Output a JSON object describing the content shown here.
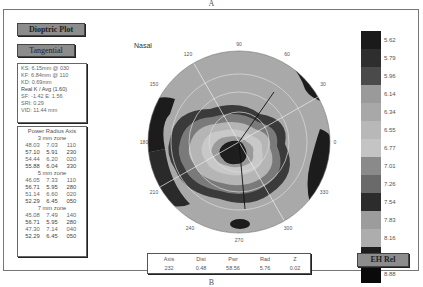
{
  "panel_labels": {
    "top": "A",
    "bottom": "B"
  },
  "header": {
    "plot_type_button": "Dioptric Plot",
    "map_type_button": "Tangential",
    "orientation_label": "Nasal"
  },
  "keratometry": {
    "ks": "KS:  6.15mm @ 030",
    "kf": "KF:  6.84mm @ 110",
    "kd": "KD:  0.69mm",
    "real_k": "Real K / Avg (1.60)",
    "sf_e": "SF:  -1.42   E:  1.56",
    "sri": "SRI:  0.29",
    "vid": "VID: 11.44 mm"
  },
  "power_radius_axis": {
    "title": "Power Radius Axis",
    "zones": [
      {
        "label": "3 mm zone",
        "rows": [
          [
            "48.03",
            "7.03",
            "110"
          ],
          [
            "57.10",
            "5.91",
            "230"
          ],
          [
            "54.44",
            "6.20",
            "020"
          ],
          [
            "55.88",
            "6.04",
            "330"
          ]
        ]
      },
      {
        "label": "5 mm zone",
        "rows": [
          [
            "46.05",
            "7.33",
            "110"
          ],
          [
            "56.71",
            "5.95",
            "280"
          ],
          [
            "51.14",
            "6.60",
            "020"
          ],
          [
            "52.29",
            "6.45",
            "050"
          ]
        ]
      },
      {
        "label": "7 mm zone",
        "rows": [
          [
            "45.08",
            "7.49",
            "140"
          ],
          [
            "56.71",
            "5.95",
            "280"
          ],
          [
            "47.30",
            "7.14",
            "040"
          ],
          [
            "52.29",
            "6.45",
            "050"
          ]
        ]
      }
    ]
  },
  "polar_axis_labels": [
    {
      "deg": 90,
      "label": "90"
    },
    {
      "deg": 60,
      "label": "60"
    },
    {
      "deg": 30,
      "label": "30"
    },
    {
      "deg": 0,
      "label": "0"
    },
    {
      "deg": 330,
      "label": "330"
    },
    {
      "deg": 300,
      "label": "300"
    },
    {
      "deg": 270,
      "label": "270"
    },
    {
      "deg": 240,
      "label": "240"
    },
    {
      "deg": 210,
      "label": "210"
    },
    {
      "deg": 180,
      "label": "180"
    },
    {
      "deg": 150,
      "label": "150"
    },
    {
      "deg": 120,
      "label": "120"
    }
  ],
  "color_scale": {
    "values": [
      "5.62",
      "5.79",
      "5.96",
      "6.14",
      "6.34",
      "6.55",
      "6.77",
      "7.01",
      "7.26",
      "7.54",
      "7.83",
      "8.16",
      "8.50",
      "8.88"
    ],
    "colors": [
      "#1a1a1a",
      "#2e2e2e",
      "#4a4a4a",
      "#9a9a9a",
      "#a8a8a8",
      "#b8b8b8",
      "#c4c4c4",
      "#8a8a8a",
      "#6a6a6a",
      "#2c2c2c",
      "#9c9c9c",
      "#adadad",
      "#1e1e1e",
      "#0a0a0a"
    ]
  },
  "scale_button": "EH Rel",
  "cursor_stats": {
    "headers": [
      "Axis",
      "Dist",
      "Pwr",
      "Rad",
      "Z"
    ],
    "values": [
      "232",
      "0.48",
      "58.56",
      "5.76",
      "0.02"
    ]
  }
}
